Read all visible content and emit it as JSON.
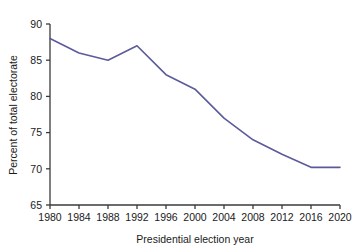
{
  "chart_data": {
    "type": "line",
    "title": "",
    "xlabel": "Presidential election year",
    "ylabel": "Percent of  total electorate",
    "x": [
      1980,
      1984,
      1988,
      1992,
      1996,
      2000,
      2004,
      2008,
      2012,
      2016,
      2020
    ],
    "values": [
      88.0,
      86.0,
      85.0,
      87.0,
      83.0,
      81.0,
      77.0,
      74.0,
      72.0,
      70.2,
      70.2
    ],
    "xticks": [
      "1980",
      "1984",
      "1988",
      "1992",
      "1996",
      "2000",
      "2004",
      "2008",
      "2012",
      "2016",
      "2020"
    ],
    "yticks": [
      "65",
      "70",
      "75",
      "80",
      "85",
      "90"
    ],
    "ytick_values": [
      65,
      70,
      75,
      80,
      85,
      90
    ],
    "xlim": [
      1980,
      2020
    ],
    "ylim": [
      65,
      90
    ],
    "grid": false,
    "legend": null,
    "series_color": "#5b5b9b",
    "axis_color": "#3a3a3a"
  }
}
